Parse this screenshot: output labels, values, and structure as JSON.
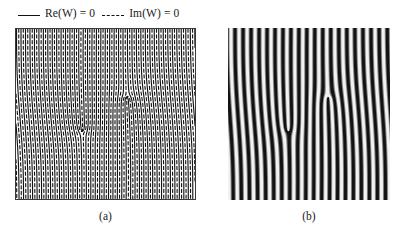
{
  "figure": {
    "legend": {
      "entries": [
        {
          "label": "Re(W) = 0",
          "style": "solid",
          "color": "#111111"
        },
        {
          "label": "Im(W) = 0",
          "style": "dashed",
          "color": "#111111"
        }
      ]
    },
    "panels": [
      {
        "id": "a",
        "caption": "(a)",
        "kind": "contour-nodal-lines",
        "border": true
      },
      {
        "id": "b",
        "caption": "(b)",
        "kind": "grayscale-fringe-pattern",
        "border": false
      }
    ]
  },
  "chart_data": [
    {
      "type": "line",
      "panel": "a",
      "title": "",
      "xlabel": "",
      "ylabel": "",
      "xlim": [
        0,
        1
      ],
      "ylim": [
        0,
        1
      ],
      "grid": false,
      "legend_position": "above-figure",
      "description": "Zero-level nodal lines of a complex field W for a bound pair of oppositely charged spiral defects. Solid curves are Re(W) = 0, dashed curves are Im(W) = 0; their crossings locate the two spiral cores.",
      "annotations": [
        {
          "text": "spiral core 1",
          "x": 0.62,
          "y": 0.6
        },
        {
          "text": "spiral core 2",
          "x": 0.37,
          "y": 0.4
        }
      ],
      "series": [
        {
          "name": "Re(W) = 0",
          "style": "solid",
          "color": "#111111",
          "defect_centers": [
            [
              0.62,
              0.6
            ],
            [
              0.37,
              0.4
            ]
          ],
          "spiral_arms": 2,
          "winding_numbers": [
            1,
            -1
          ]
        },
        {
          "name": "Im(W) = 0",
          "style": "dashed",
          "color": "#111111",
          "defect_centers": [
            [
              0.62,
              0.6
            ],
            [
              0.37,
              0.4
            ]
          ],
          "spiral_arms": 2,
          "winding_numbers": [
            1,
            -1
          ],
          "phase_offset_deg": 90
        }
      ]
    },
    {
      "type": "heatmap",
      "panel": "b",
      "title": "",
      "xlabel": "",
      "ylabel": "",
      "xlim": [
        0,
        1
      ],
      "ylim": [
        0,
        1
      ],
      "grid": false,
      "colormap": "gray",
      "vmin": -1,
      "vmax": 1,
      "description": "Grayscale map of Re(W) showing nearly vertical interference fringes with two fork dislocations at the spiral-core positions of panel (a).",
      "fringe_count": 20,
      "fringe_orientation_deg": 88,
      "dislocations": [
        {
          "x": 0.62,
          "y": 0.6,
          "charge": 1
        },
        {
          "x": 0.37,
          "y": 0.4,
          "charge": -1
        }
      ]
    }
  ]
}
